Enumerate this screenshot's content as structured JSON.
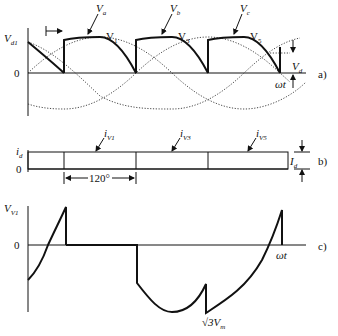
{
  "figure": {
    "panel_a": {
      "label": "a)",
      "y_label": "V",
      "y_label_sub": "d1",
      "zero_label": "0",
      "x_label": "ωt",
      "phase_labels": [
        {
          "name": "V",
          "sub": "a"
        },
        {
          "name": "V",
          "sub": "b"
        },
        {
          "name": "V",
          "sub": "c"
        }
      ],
      "device_labels": [
        {
          "name": "V",
          "sub": "1"
        },
        {
          "name": "V",
          "sub": "3"
        },
        {
          "name": "V",
          "sub": "5"
        }
      ],
      "dim_label": "V",
      "dim_label_sub": "d"
    },
    "panel_b": {
      "label": "b)",
      "y_label": "i",
      "y_label_sub": "d",
      "zero_label": "0",
      "current_labels": [
        {
          "name": "i",
          "sub": "V1"
        },
        {
          "name": "i",
          "sub": "V3"
        },
        {
          "name": "i",
          "sub": "V5"
        }
      ],
      "angle_label": "120°",
      "dim_label": "I",
      "dim_label_sub": "d"
    },
    "panel_c": {
      "label": "c)",
      "y_label": "V",
      "y_label_sub": "V1",
      "zero_label": "0",
      "x_label": "ωt",
      "peak_label": "√3V",
      "peak_label_sub": "m"
    }
  }
}
